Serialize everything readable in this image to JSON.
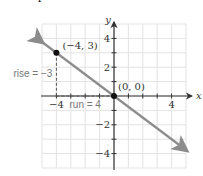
{
  "problem_number": "4",
  "chart_data": {
    "type": "line",
    "title": "",
    "xlabel": "x",
    "ylabel": "y",
    "xlim": [
      -5,
      5
    ],
    "ylim": [
      -5,
      5
    ],
    "grid": true,
    "x_ticks": [
      "-4",
      "4"
    ],
    "y_ticks": [
      "4",
      "2",
      "-2",
      "-4"
    ],
    "series": [
      {
        "name": "line",
        "x": [
          -5,
          5
        ],
        "y": [
          3.75,
          -3.75
        ],
        "slope": -0.75
      }
    ],
    "points": [
      {
        "label": "(−4, 3)",
        "x": -4,
        "y": 3
      },
      {
        "label": "(0, 0)",
        "x": 0,
        "y": 0
      }
    ],
    "annotations": [
      {
        "text": "rise = −3"
      },
      {
        "text": "run = 4"
      }
    ],
    "colors": {
      "line": "#8c8c8c",
      "grid": "#e3e3e3",
      "axis": "#333333",
      "point": "#111111"
    }
  }
}
